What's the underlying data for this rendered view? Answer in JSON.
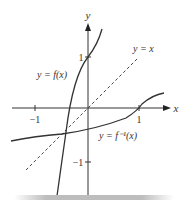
{
  "diagram": {
    "axes": {
      "x_label": "x",
      "y_label": "y",
      "x_ticks": [
        {
          "value": -1,
          "label": "−1"
        },
        {
          "value": 1,
          "label": "1"
        }
      ],
      "y_ticks": [
        {
          "value": 1,
          "label": "1"
        },
        {
          "value": -1,
          "label": "−1"
        }
      ]
    },
    "curves": [
      {
        "name": "f",
        "label": "y = f(x)",
        "style": "solid"
      },
      {
        "name": "f-inverse",
        "label": "y = f⁻¹(x)",
        "style": "solid"
      },
      {
        "name": "identity",
        "label": "y = x",
        "style": "dashed"
      }
    ],
    "colors": {
      "curve": "#333333",
      "axis": "#333333",
      "shadow": "#bdbdbd"
    }
  }
}
